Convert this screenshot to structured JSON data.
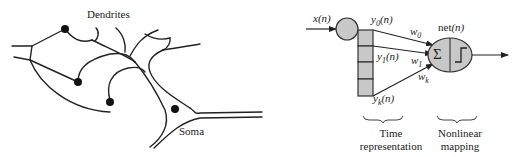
{
  "biological_neuron": {
    "labels": {
      "dendrites": "Dendrites",
      "soma": "Soma"
    }
  },
  "artificial_neuron": {
    "input_label": "x(n)",
    "taps": [
      {
        "label": "y0(n)",
        "sym": "y",
        "sub": "0",
        "arg": "(n)"
      },
      {
        "label": "y1(n)",
        "sym": "y",
        "sub": "1",
        "arg": "(n)"
      },
      {
        "label": "yk(n)",
        "sym": "y",
        "sub": "k",
        "arg": "(n)"
      }
    ],
    "weights": [
      {
        "label": "w0",
        "sym": "w",
        "sub": "0"
      },
      {
        "label": "w1",
        "sym": "w",
        "sub": "1"
      },
      {
        "label": "wk",
        "sym": "w",
        "sub": "k"
      }
    ],
    "net_label": {
      "text": "net",
      "arg": "(n)"
    },
    "sum_symbol": "Σ",
    "captions": {
      "time_line1": "Time",
      "time_line2": "representation",
      "nonlin_line1": "Nonlinear",
      "nonlin_line2": "mapping"
    },
    "colors": {
      "fill": "#c8c8c8",
      "stroke": "#333333"
    }
  }
}
